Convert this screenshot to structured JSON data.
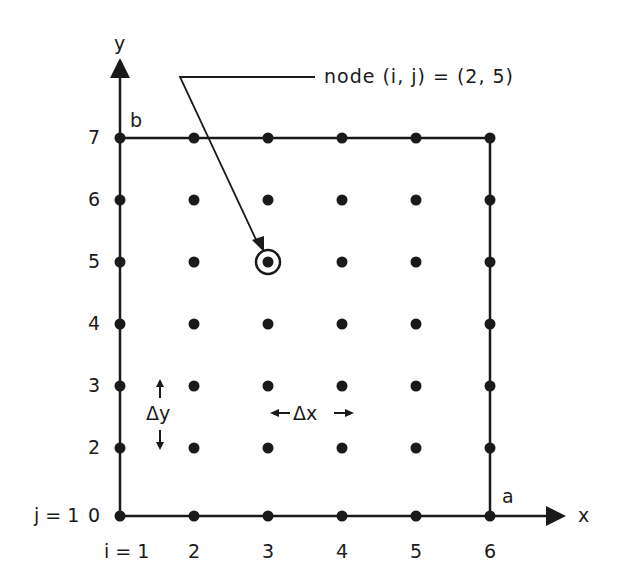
{
  "diagram": {
    "axis_x_label": "x",
    "axis_y_label": "y",
    "corner_label_a": "a",
    "corner_label_b": "b",
    "callout_text": "node (i, j) = (2, 5)",
    "highlighted_node": {
      "i_col": 3,
      "j_row": 5
    },
    "delta_x_label": "Δx",
    "delta_y_label": "Δy",
    "x_ticks": [
      "i = 1",
      "2",
      "3",
      "4",
      "5",
      "6"
    ],
    "y_ticks": [
      "0",
      "2",
      "3",
      "4",
      "5",
      "6",
      "7"
    ],
    "j_label": "j = 1",
    "colors": {
      "ink": "#1a1a1a",
      "background": "#ffffff"
    }
  }
}
